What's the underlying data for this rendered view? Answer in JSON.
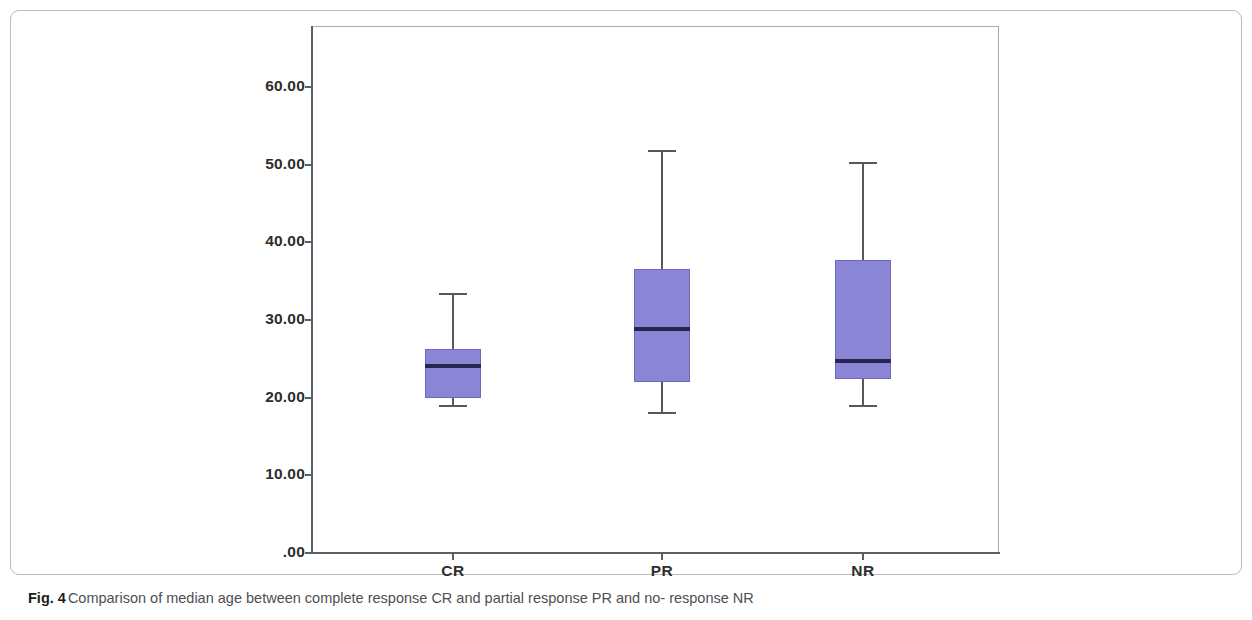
{
  "figure": {
    "caption_label": "Fig. 4",
    "caption_text": "Comparison of median age between complete response CR and partial response PR and no- response NR"
  },
  "chart_data": {
    "type": "box",
    "title": "",
    "xlabel": "",
    "ylabel": "",
    "categories": [
      "CR",
      "PR",
      "NR"
    ],
    "ylim": [
      0,
      65
    ],
    "ytick_labels": [
      ".00",
      "10.00",
      "20.00",
      "30.00",
      "40.00",
      "50.00",
      "60.00"
    ],
    "ytick_values": [
      0,
      10,
      20,
      30,
      40,
      50,
      60
    ],
    "grid": false,
    "legend": "none",
    "box_color": "#8b85d6",
    "box_edge_color": "#6f69bc",
    "median_color": "#2a2550",
    "whisker_color": "#55585e",
    "boxes": [
      {
        "category": "CR",
        "whisker_low": 19.1,
        "q1": 20.0,
        "median": 24.1,
        "q3": 26.3,
        "whisker_high": 33.5
      },
      {
        "category": "PR",
        "whisker_low": 18.2,
        "q1": 22.0,
        "median": 28.8,
        "q3": 36.6,
        "whisker_high": 51.9
      },
      {
        "category": "NR",
        "whisker_low": 19.1,
        "q1": 22.4,
        "median": 24.7,
        "q3": 37.7,
        "whisker_high": 50.4
      }
    ]
  }
}
